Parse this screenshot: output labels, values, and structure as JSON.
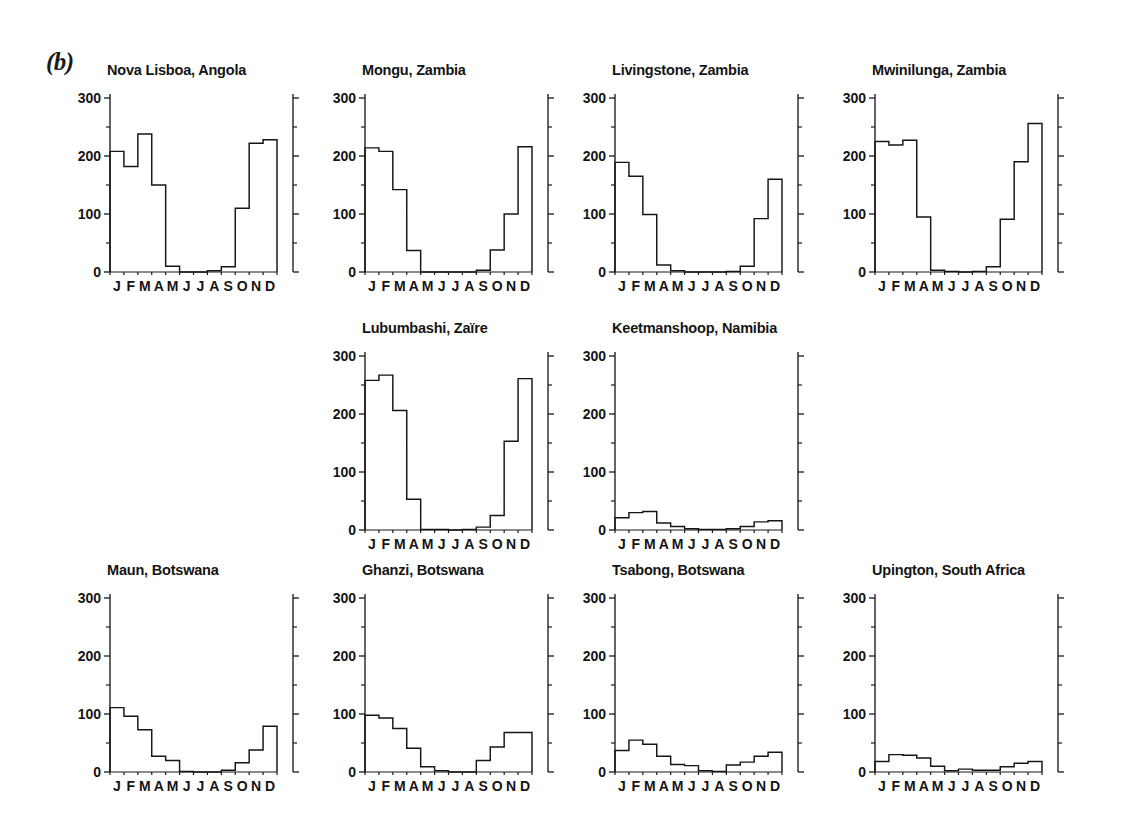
{
  "figure": {
    "panel_label": "(b)",
    "units": "mm",
    "months": [
      "J",
      "F",
      "M",
      "A",
      "M",
      "J",
      "J",
      "A",
      "S",
      "O",
      "N",
      "D"
    ],
    "y_ticks_major": [
      0,
      100,
      200,
      300
    ],
    "y_ticks_minor": [
      50,
      150,
      250
    ],
    "ylim": [
      0,
      300
    ]
  },
  "chart_data": [
    {
      "type": "line",
      "title": "Nova Lisboa, Angola",
      "xlabel": "",
      "ylabel": "",
      "ylim": [
        0,
        300
      ],
      "categories": [
        "J",
        "F",
        "M",
        "A",
        "M",
        "J",
        "J",
        "A",
        "S",
        "O",
        "N",
        "D"
      ],
      "values": [
        208,
        182,
        238,
        150,
        10,
        0,
        0,
        2,
        9,
        110,
        222,
        228
      ],
      "grid": false,
      "legend": "none"
    },
    {
      "type": "line",
      "title": "Mongu, Zambia",
      "xlabel": "",
      "ylabel": "",
      "ylim": [
        0,
        300
      ],
      "categories": [
        "J",
        "F",
        "M",
        "A",
        "M",
        "J",
        "J",
        "A",
        "S",
        "O",
        "N",
        "D"
      ],
      "values": [
        214,
        208,
        142,
        37,
        0,
        0,
        0,
        0,
        3,
        38,
        100,
        216
      ],
      "grid": false,
      "legend": "none"
    },
    {
      "type": "line",
      "title": "Livingstone, Zambia",
      "xlabel": "",
      "ylabel": "",
      "ylim": [
        0,
        300
      ],
      "categories": [
        "J",
        "F",
        "M",
        "A",
        "M",
        "J",
        "J",
        "A",
        "S",
        "O",
        "N",
        "D"
      ],
      "values": [
        189,
        165,
        99,
        12,
        2,
        0,
        0,
        0,
        1,
        10,
        92,
        160
      ],
      "grid": false,
      "legend": "none"
    },
    {
      "type": "line",
      "title": "Mwinilunga, Zambia",
      "xlabel": "",
      "ylabel": "",
      "ylim": [
        0,
        300
      ],
      "categories": [
        "J",
        "F",
        "M",
        "A",
        "M",
        "J",
        "J",
        "A",
        "S",
        "O",
        "N",
        "D"
      ],
      "values": [
        225,
        219,
        227,
        95,
        3,
        1,
        0,
        1,
        9,
        91,
        190,
        256
      ],
      "grid": false,
      "legend": "none"
    },
    {
      "type": "line",
      "title": "Lubumbashi, Zaïre",
      "xlabel": "",
      "ylabel": "",
      "ylim": [
        0,
        300
      ],
      "categories": [
        "J",
        "F",
        "M",
        "A",
        "M",
        "J",
        "J",
        "A",
        "S",
        "O",
        "N",
        "D"
      ],
      "values": [
        258,
        267,
        206,
        53,
        1,
        1,
        0,
        1,
        5,
        25,
        153,
        261
      ],
      "grid": false,
      "legend": "none"
    },
    {
      "type": "line",
      "title": "Keetmanshoop, Namibia",
      "xlabel": "",
      "ylabel": "",
      "ylim": [
        0,
        300
      ],
      "categories": [
        "J",
        "F",
        "M",
        "A",
        "M",
        "J",
        "J",
        "A",
        "S",
        "O",
        "N",
        "D"
      ],
      "values": [
        21,
        30,
        32,
        12,
        6,
        2,
        1,
        1,
        2,
        6,
        14,
        16
      ],
      "grid": false,
      "legend": "none"
    },
    {
      "type": "line",
      "title": "Maun, Botswana",
      "xlabel": "",
      "ylabel": "",
      "ylim": [
        0,
        300
      ],
      "categories": [
        "J",
        "F",
        "M",
        "A",
        "M",
        "J",
        "J",
        "A",
        "S",
        "O",
        "N",
        "D"
      ],
      "values": [
        111,
        96,
        73,
        27,
        20,
        1,
        0,
        0,
        3,
        16,
        38,
        79
      ],
      "grid": false,
      "legend": "none"
    },
    {
      "type": "line",
      "title": "Ghanzi, Botswana",
      "xlabel": "",
      "ylabel": "",
      "ylim": [
        0,
        300
      ],
      "categories": [
        "J",
        "F",
        "M",
        "A",
        "M",
        "J",
        "J",
        "A",
        "S",
        "O",
        "N",
        "D"
      ],
      "values": [
        98,
        93,
        75,
        41,
        9,
        2,
        0,
        0,
        20,
        43,
        68,
        68
      ],
      "grid": false,
      "legend": "none"
    },
    {
      "type": "line",
      "title": "Tsabong, Botswana",
      "xlabel": "",
      "ylabel": "",
      "ylim": [
        0,
        300
      ],
      "categories": [
        "J",
        "F",
        "M",
        "A",
        "M",
        "J",
        "J",
        "A",
        "S",
        "O",
        "N",
        "D"
      ],
      "values": [
        37,
        55,
        48,
        27,
        13,
        11,
        2,
        1,
        12,
        17,
        27,
        34
      ],
      "grid": false,
      "legend": "none"
    },
    {
      "type": "line",
      "title": "Upington, South Africa",
      "xlabel": "",
      "ylabel": "",
      "ylim": [
        0,
        300
      ],
      "categories": [
        "J",
        "F",
        "M",
        "A",
        "M",
        "J",
        "J",
        "A",
        "S",
        "O",
        "N",
        "D"
      ],
      "values": [
        18,
        30,
        29,
        24,
        10,
        2,
        5,
        3,
        3,
        9,
        15,
        18
      ],
      "grid": false,
      "legend": "none"
    }
  ],
  "layout": {
    "rows": [
      {
        "name": "row-1",
        "panel_indices": [
          0,
          1,
          2,
          3
        ],
        "lefts": [
          55,
          310,
          560,
          820
        ]
      },
      {
        "name": "row-2",
        "panel_indices": [
          4,
          5
        ],
        "lefts": [
          310,
          560
        ]
      },
      {
        "name": "row-3",
        "panel_indices": [
          6,
          7,
          8,
          9
        ],
        "lefts": [
          55,
          310,
          560,
          820
        ]
      }
    ]
  }
}
